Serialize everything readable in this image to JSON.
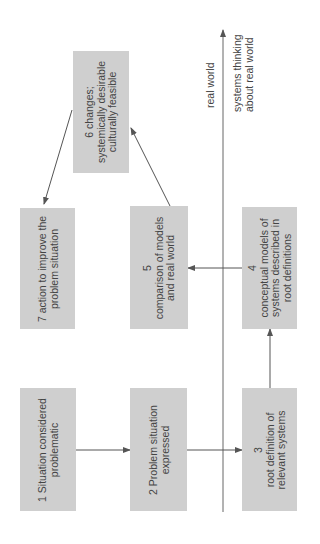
{
  "diagram": {
    "orientation": "rotated 90 degrees counter-clockwise",
    "boxes": [
      {
        "id": 1,
        "text": "1 Situation considered\nproblematic"
      },
      {
        "id": 2,
        "text": "2 Problem situation\nexpressed"
      },
      {
        "id": 3,
        "text": "3\nroot definition of\nrelevant systems"
      },
      {
        "id": 4,
        "text": "4\nconceptual models of\nsystems described in\nroot definitions"
      },
      {
        "id": 5,
        "text": "5\ncomparison of models\nand real world"
      },
      {
        "id": 6,
        "text": "6 changes;\nsystemically desirable\nculturally feasible"
      },
      {
        "id": 7,
        "text": "7 action to improve the\nproblem situation"
      }
    ],
    "divider_labels": {
      "above": "real world",
      "below": "systems thinking\nabout real world"
    },
    "edges": [
      {
        "from": 1,
        "to": 2
      },
      {
        "from": 2,
        "to": 3
      },
      {
        "from": 3,
        "to": 4
      },
      {
        "from": 4,
        "to": 5
      },
      {
        "from": 5,
        "to": 6
      },
      {
        "from": 6,
        "to": 7
      }
    ],
    "colors": {
      "box_fill": "#cfcfcf",
      "line": "#555555",
      "text": "#444444"
    }
  }
}
